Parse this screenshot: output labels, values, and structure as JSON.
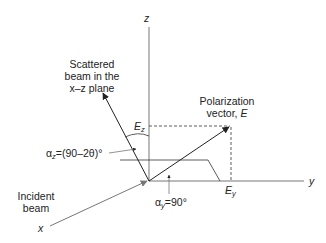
{
  "diagram": {
    "axes": {
      "z": "z",
      "y": "y",
      "x": "x"
    },
    "labels": {
      "scattered_beam": [
        "Scattered",
        "beam in the",
        "x–z plane"
      ],
      "polarization_vector_line1": "Polarization",
      "polarization_vector_line2": "vector, ",
      "polarization_vector_symbol": "E",
      "incident_beam": [
        "Incident",
        "beam"
      ],
      "ez_main": "E",
      "ez_sub": "z",
      "ey_main": "E",
      "ey_sub": "y",
      "alpha_z_prefix": "α",
      "alpha_z_sub": "z",
      "alpha_z_value": "=(90–2θ)°",
      "alpha_y_prefix": "α",
      "alpha_y_sub": "y",
      "alpha_y_value": "=90°"
    },
    "colors": {
      "line": "#333333",
      "beam": "#777777",
      "text": "#222222"
    }
  }
}
